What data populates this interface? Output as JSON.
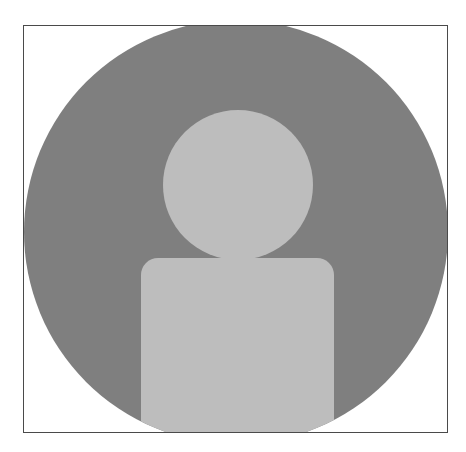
{
  "avatar": {
    "label": "Default user avatar placeholder",
    "icon": "user-silhouette-icon",
    "colors": {
      "frame_border": "#4a4a4a",
      "background": "#ffffff",
      "circle": "#7f7f7f",
      "silhouette": "#bdbdbd"
    }
  }
}
